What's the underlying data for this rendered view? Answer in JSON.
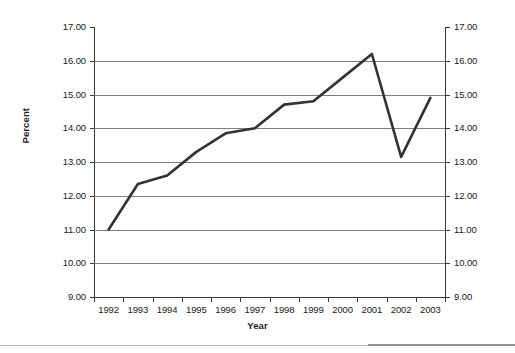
{
  "chart_data": {
    "type": "line",
    "title": "",
    "xlabel": "Year",
    "ylabel": "Percent",
    "categories": [
      "1992",
      "1993",
      "1994",
      "1995",
      "1996",
      "1997",
      "1998",
      "1999",
      "2000",
      "2001",
      "2002",
      "2003"
    ],
    "values": [
      11.0,
      12.35,
      12.6,
      13.3,
      13.85,
      14.0,
      14.7,
      14.8,
      15.5,
      16.2,
      13.15,
      14.9
    ],
    "series": [
      {
        "name": "Percent",
        "values": [
          11.0,
          12.35,
          12.6,
          13.3,
          13.85,
          14.0,
          14.7,
          14.8,
          15.5,
          16.2,
          13.15,
          14.9
        ]
      }
    ],
    "ylim": [
      9.0,
      17.0
    ],
    "ytick_step": 1.0,
    "ytick_labels": [
      "17.00",
      "16.00",
      "15.00",
      "14.00",
      "13.00",
      "12.00",
      "11.00",
      "10.00",
      "9.00"
    ],
    "ytick_values": [
      17.0,
      16.0,
      15.0,
      14.0,
      13.0,
      12.0,
      11.0,
      10.0,
      9.0
    ],
    "ytick_labels_right": [
      "17.00",
      "16.00",
      "15.00",
      "14.00",
      "13.00",
      "12.00",
      "11.00",
      "10.00",
      "9.00"
    ],
    "dual_axis": true,
    "grid": true,
    "grid_axis": "y",
    "legend": false,
    "legend_position": "none",
    "markers": false,
    "line_color": "#333333",
    "grid_color": "#7d7d7d",
    "axis_color": "#3a3a3a",
    "background": "#ffffff"
  }
}
